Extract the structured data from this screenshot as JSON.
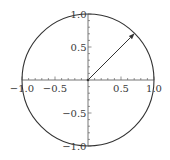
{
  "chart_data": {
    "type": "line",
    "title": "",
    "xlabel": "",
    "ylabel": "",
    "xlim": [
      -1.0,
      1.0
    ],
    "ylim": [
      -1.0,
      1.0
    ],
    "grid": false,
    "legend": null,
    "aspect": "equal",
    "axes_origin": [
      0,
      0
    ],
    "x_ticks": [
      -1.0,
      -0.5,
      0.5,
      1.0
    ],
    "x_tick_labels": [
      "−1.0",
      "−0.5",
      "0.5",
      "1.0"
    ],
    "y_ticks": [
      1.0,
      0.5,
      -0.5,
      -1.0
    ],
    "y_tick_labels": [
      "1.0",
      "0.5",
      "−0.5",
      "−1.0"
    ],
    "minor_tick_step": 0.1,
    "series": [
      {
        "name": "unit circle",
        "kind": "circle",
        "center": [
          0,
          0
        ],
        "radius": 1.0
      },
      {
        "name": "unit vector",
        "kind": "arrow",
        "from": [
          0,
          0
        ],
        "to": [
          0.707,
          0.707
        ]
      }
    ],
    "colors": {
      "line": "#333333",
      "axis": "#666666",
      "text": "#3a3a3a"
    }
  }
}
